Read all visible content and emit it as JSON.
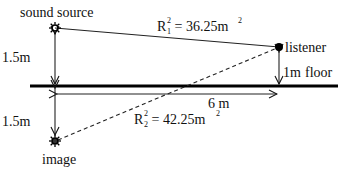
{
  "diagram": {
    "labels": {
      "source": "sound source",
      "listener": "listener",
      "image": "image",
      "floor": "floor",
      "source_height": "1.5m",
      "image_depth": "1.5m",
      "listener_height": "1m",
      "horizontal_distance": "6 m"
    },
    "direct_path": {
      "symbol": "R",
      "subscript": "1",
      "superscript": "2",
      "equals": " = 36.25m",
      "unit_exp": "2"
    },
    "reflected_path": {
      "symbol": "R",
      "subscript": "2",
      "superscript": "2",
      "equals": " = 42.25m",
      "unit_exp": "2"
    }
  }
}
